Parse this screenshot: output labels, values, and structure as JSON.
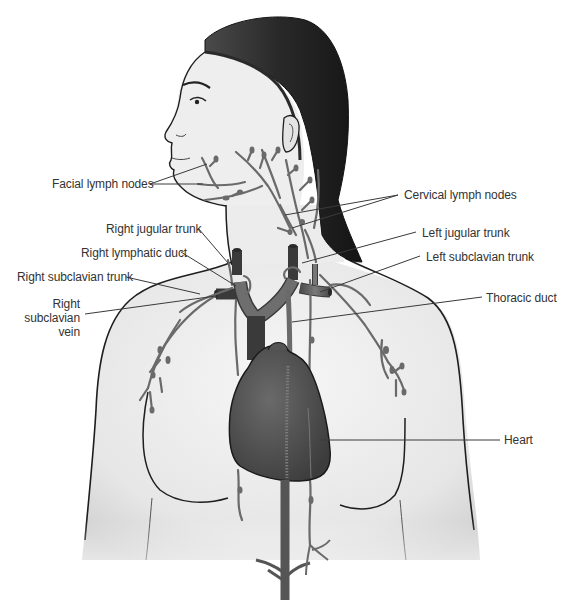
{
  "diagram": {
    "colors": {
      "background": "#ffffff",
      "skin": "#ececec",
      "skin_shadow": "#d6d6d6",
      "outline": "#1e1e1e",
      "hair": "#262626",
      "vessel": "#6a6a6a",
      "vein": "#5a5a5a",
      "heart": "#4d4d4d",
      "label_text": "#333333",
      "leader_line": "#3a3a3a"
    },
    "labels": {
      "facial_lymph_nodes": "Facial lymph nodes",
      "cervical_lymph_nodes": "Cervical lymph nodes",
      "right_jugular_trunk": "Right jugular trunk",
      "right_lymphatic_duct": "Right lymphatic duct",
      "right_subclavian_trunk": "Right subclavian trunk",
      "right_subclavian_vein_line1": "Right",
      "right_subclavian_vein_line2": "subclavian",
      "right_subclavian_vein_line3": "vein",
      "left_jugular_trunk": "Left jugular trunk",
      "left_subclavian_trunk": "Left subclavian trunk",
      "thoracic_duct": "Thoracic duct",
      "heart": "Heart"
    }
  }
}
